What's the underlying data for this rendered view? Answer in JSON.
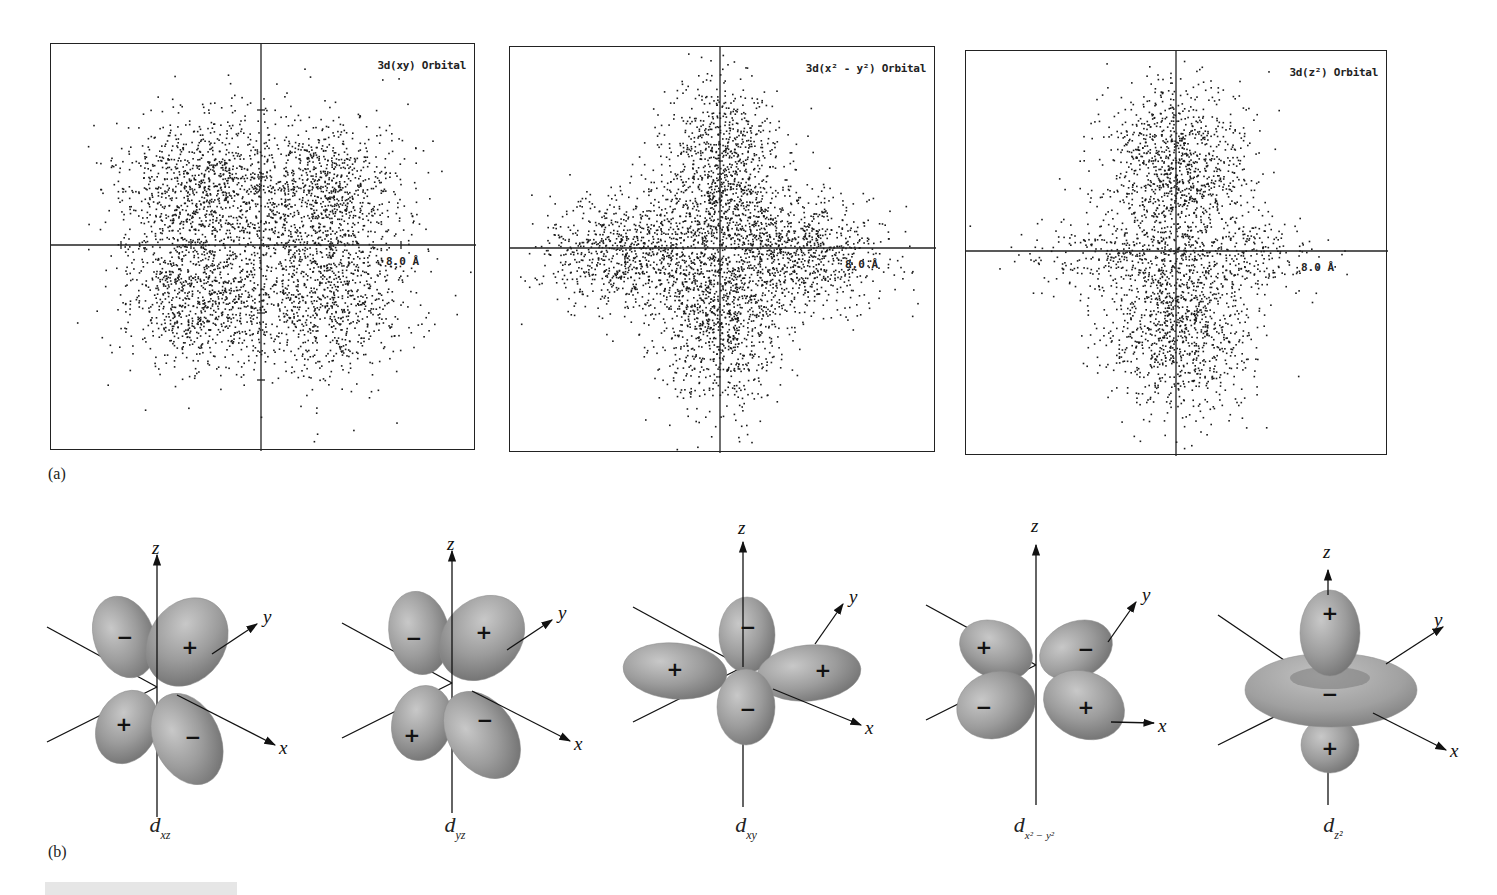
{
  "figure": {
    "part_a_label": "(a)",
    "part_b_label": "(b)"
  },
  "scatter_panels": [
    {
      "id": "xy",
      "title": "3d(xy) Orbital",
      "scale_label": "8.0 Å",
      "box": {
        "x": 50,
        "y": 43,
        "w": 425,
        "h": 407
      },
      "origin": {
        "x": 210,
        "y": 201
      },
      "lobes": [
        {
          "cx": -60,
          "cy": -55,
          "sx": 40,
          "sy": 38,
          "n": 950
        },
        {
          "cx": 60,
          "cy": -55,
          "sx": 40,
          "sy": 38,
          "n": 950
        },
        {
          "cx": -60,
          "cy": 48,
          "sx": 40,
          "sy": 40,
          "n": 950
        },
        {
          "cx": 62,
          "cy": 50,
          "sx": 42,
          "sy": 42,
          "n": 950
        }
      ],
      "ticks_x": [
        -140,
        -70,
        70,
        140
      ],
      "ticks_y": [
        -135,
        -68,
        68,
        135
      ],
      "seed": 11
    },
    {
      "id": "x2y2",
      "title": "3d(x² - y²) Orbital",
      "scale_label": "8.0 Å",
      "box": {
        "x": 509,
        "y": 46,
        "w": 426,
        "h": 406
      },
      "origin": {
        "x": 210,
        "y": 201
      },
      "lobes": [
        {
          "cx": 0,
          "cy": -80,
          "sx": 30,
          "sy": 45,
          "n": 950
        },
        {
          "cx": 0,
          "cy": 68,
          "sx": 30,
          "sy": 46,
          "n": 950
        },
        {
          "cx": -85,
          "cy": 5,
          "sx": 46,
          "sy": 30,
          "n": 950
        },
        {
          "cx": 75,
          "cy": 5,
          "sx": 44,
          "sy": 30,
          "n": 950
        }
      ],
      "ticks_x": [],
      "ticks_y": [],
      "seed": 23
    },
    {
      "id": "z2",
      "title": "3d(z²) Orbital",
      "scale_label": "8.0 Å",
      "box": {
        "x": 965,
        "y": 50,
        "w": 422,
        "h": 405
      },
      "origin": {
        "x": 210,
        "y": 200
      },
      "lobes": [
        {
          "cx": 0,
          "cy": -80,
          "sx": 36,
          "sy": 44,
          "n": 1100
        },
        {
          "cx": 0,
          "cy": 68,
          "sx": 36,
          "sy": 48,
          "n": 1150
        },
        {
          "cx": -75,
          "cy": 3,
          "sx": 42,
          "sy": 18,
          "n": 220
        },
        {
          "cx": 70,
          "cy": 3,
          "sx": 40,
          "sy": 18,
          "n": 200
        }
      ],
      "ticks_x": [],
      "ticks_y": [],
      "seed": 37
    }
  ],
  "orbital_diagrams": [
    {
      "id": "dxz",
      "caption_main": "d",
      "caption_sub": "xz",
      "caption_sup": "",
      "origin": {
        "x": 157,
        "y": 687
      },
      "signs": [
        "−",
        "+",
        "+",
        "−"
      ]
    },
    {
      "id": "dyz",
      "caption_main": "d",
      "caption_sub": "yz",
      "caption_sup": "",
      "origin": {
        "x": 452,
        "y": 683
      },
      "signs": [
        "−",
        "+",
        "+",
        "−"
      ]
    },
    {
      "id": "dxy",
      "caption_main": "d",
      "caption_sub": "xy",
      "caption_sup": "",
      "origin": {
        "x": 743,
        "y": 667
      },
      "signs": [
        "−",
        "+",
        "+",
        "−"
      ]
    },
    {
      "id": "dx2y2",
      "caption_main": "d",
      "caption_sub": "x² − y²",
      "caption_sup": "",
      "origin": {
        "x": 1036,
        "y": 665
      },
      "signs": [
        "+",
        "−",
        "−",
        "+"
      ]
    },
    {
      "id": "dz2",
      "caption_main": "d",
      "caption_sub": "z²",
      "caption_sup": "",
      "origin": {
        "x": 1328,
        "y": 690
      },
      "signs": [
        "+",
        "−",
        "+"
      ]
    }
  ],
  "axis_labels": {
    "x": "x",
    "y": "y",
    "z": "z"
  },
  "colors": {
    "lobe_fill": "#9a9a9a",
    "lobe_highlight": "#c4c4c4",
    "lobe_shadow": "#6e6e6e",
    "axis": "#111111",
    "dot": "#1a1a1a"
  }
}
